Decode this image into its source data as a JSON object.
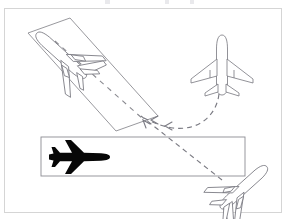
{
  "figure": {
    "background_color": "#ffffff",
    "frame": {
      "name": "figure-border",
      "x": 4,
      "y": 8,
      "width": 278,
      "height": 205,
      "stroke_color": "#d5d5d5"
    },
    "colors": {
      "outline_stroke": "#76767e",
      "runway_stroke": "#8c8c92",
      "silhouette_fill": "#070707",
      "path_stroke": "#7b7b83",
      "frame_stroke": "#d5d5d5",
      "background": "#ffffff"
    },
    "runways": [
      {
        "id": "diagonal-runway",
        "label": "Diagonal runway",
        "orientation": "diagonal",
        "corners": "28,33 70,18 158,116 116,131",
        "centerline_marking": "dashed",
        "centerline": "55,41 143,119"
      },
      {
        "id": "horizontal-runway",
        "label": "Horizontal runway",
        "orientation": "horizontal",
        "corners": "41,137 245,137 245,176 41,176",
        "centerline_marking": "none",
        "centerline": ""
      }
    ],
    "aircraft": [
      {
        "id": "aircraft-diagonal-runway",
        "label": "Aircraft on diagonal runway",
        "style": "outline",
        "view": "rear-three-quarter",
        "heading": "down-left",
        "position": {
          "x": 22,
          "y": 22
        }
      },
      {
        "id": "aircraft-top-view",
        "label": "Aircraft in flight top view",
        "style": "outline",
        "view": "top",
        "heading": "up",
        "position": {
          "x": 198,
          "y": 36
        }
      },
      {
        "id": "aircraft-silhouette",
        "label": "Aircraft silhouette on horizontal runway",
        "style": "silhouette",
        "view": "top",
        "heading": "right",
        "position": {
          "x": 49,
          "y": 142
        }
      },
      {
        "id": "aircraft-bottom-right",
        "label": "Aircraft at runway threshold",
        "style": "outline",
        "view": "rear-three-quarter",
        "heading": "down-right",
        "position": {
          "x": 208,
          "y": 168
        }
      }
    ],
    "paths": [
      {
        "id": "curved-path",
        "label": "Curved approach path",
        "style": "dashed",
        "shape": "curve",
        "from": "aircraft-top-view",
        "to": "diagonal-runway",
        "geometry": "M 219,94 C 216,118 196,131 173,128 C 160,126 152,122 144,118"
      },
      {
        "id": "straight-path",
        "label": "Straight taxi path",
        "style": "dashed",
        "shape": "line",
        "from": "aircraft-bottom-right",
        "to": "diagonal-runway",
        "geometry": "M 222,180 L 141,116"
      }
    ],
    "arrowheads": [
      {
        "id": "arrowhead-curve-1",
        "points": "158,116 151,120 158,124"
      },
      {
        "id": "arrowhead-curve-2",
        "points": "172,122 165,126 172,130"
      },
      {
        "id": "arrowhead-line-1",
        "points": "151,125 144,121 146,129"
      }
    ]
  }
}
